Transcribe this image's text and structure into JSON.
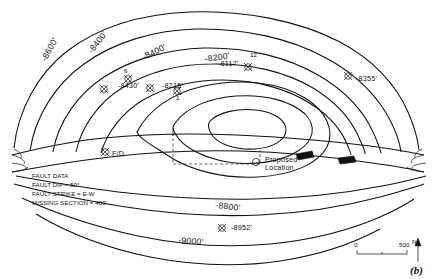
{
  "figure": {
    "panel_label": "(b)",
    "domain": "structure contour map with fault",
    "background": "#ffffff",
    "line_color": "#121212"
  },
  "contours": {
    "labels": [
      {
        "id": "c8600-left",
        "text": "-8600'",
        "x": 46,
        "y": 62,
        "rotate": -62
      },
      {
        "id": "c8400-left",
        "text": "-8400'",
        "x": 92,
        "y": 54,
        "rotate": -52
      },
      {
        "id": "c8400-mid",
        "text": "-8400'",
        "x": 144,
        "y": 60,
        "rotate": -26
      },
      {
        "id": "c8200",
        "text": "-8200'",
        "x": 205,
        "y": 62,
        "rotate": -8
      },
      {
        "id": "c8800",
        "text": "-8800'",
        "x": 215,
        "y": 208,
        "rotate": 6
      },
      {
        "id": "c9000",
        "text": "-9000'",
        "x": 178,
        "y": 243,
        "rotate": 4
      }
    ]
  },
  "wells": [
    {
      "id": "w8430",
      "label": "-8430'",
      "lx": 118,
      "ly": 88,
      "mx": 104,
      "my": 89,
      "symbol": "cross-circle"
    },
    {
      "id": "w6",
      "label": "6",
      "lx": 124,
      "ly": 73,
      "mx": 128,
      "my": 79,
      "symbol": "cross-circle"
    },
    {
      "id": "w8215",
      "label": "-8215'",
      "lx": 162,
      "ly": 88,
      "mx": 150,
      "my": 88,
      "symbol": "cross-circle"
    },
    {
      "id": "w1",
      "label": "1",
      "lx": 176,
      "ly": 96,
      "mx": 177,
      "my": 91,
      "symbol": "cross-circle"
    },
    {
      "id": "w8117",
      "label": "-8117'",
      "lx": 231,
      "ly": 65,
      "mx": 248,
      "my": 67,
      "symbol": "cross-circle"
    },
    {
      "id": "w12",
      "label": "12",
      "lx": 250,
      "ly": 56,
      "mx": 248,
      "my": 67,
      "symbol": "none"
    },
    {
      "id": "w8355",
      "label": "-8355'",
      "lx": 360,
      "ly": 81,
      "mx": 348,
      "my": 76,
      "symbol": "cross-circle"
    },
    {
      "id": "wFD",
      "label": "F/D",
      "lx": 116,
      "ly": 155,
      "mx": 105,
      "my": 152,
      "symbol": "cross-circle"
    },
    {
      "id": "w8952",
      "label": "-8952'",
      "lx": 234,
      "ly": 229,
      "mx": 222,
      "my": 228,
      "symbol": "cross-circle"
    }
  ],
  "proposed": {
    "label": "Proposed",
    "label2": "Location",
    "lx": 266,
    "ly": 163,
    "mx": 256,
    "my": 162,
    "symbol": "open-circle"
  },
  "fault_data": {
    "title": "FAULT DATA",
    "lines": [
      "FAULT DIP = 50°",
      "FAULT STRIKE = E-W",
      "MISSING SECTION = 400'"
    ],
    "x": 32,
    "y": 176
  },
  "scale_bar": {
    "left_label": "0",
    "right_label": "500",
    "x": 355,
    "y": 252,
    "width": 52
  },
  "north_arrow": {
    "label": "N",
    "x": 414,
    "y": 252
  }
}
